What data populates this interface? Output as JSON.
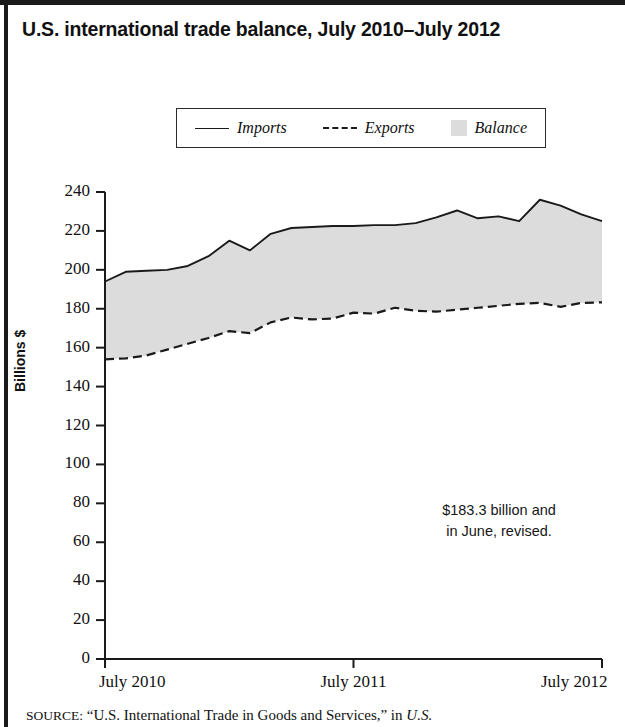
{
  "figure": {
    "title": "U.S. international trade balance, July 2010–July 2012",
    "annotation_line1": "$183.3 billion and",
    "annotation_line2": "in June, revised.",
    "source_prefix": "SOURCE:",
    "source_text": "“U.S. International Trade in Goods and Services,” in",
    "source_italic": "U.S."
  },
  "legend": {
    "items": [
      {
        "label": "Imports",
        "style": "solid",
        "color": "#1a1a1a"
      },
      {
        "label": "Exports",
        "style": "dashed",
        "color": "#1a1a1a"
      },
      {
        "label": "Balance",
        "style": "fill",
        "color": "#dcdcdc"
      }
    ]
  },
  "chart_data": {
    "type": "area",
    "title": "U.S. international trade balance, July 2010–July 2012",
    "xlabel": "",
    "ylabel": "Billions $",
    "ylim": [
      0,
      240
    ],
    "ytick_step": 20,
    "yticks": [
      0,
      20,
      40,
      60,
      80,
      100,
      120,
      140,
      160,
      180,
      200,
      220,
      240
    ],
    "grid": false,
    "legend_position": "top-center",
    "x": [
      "July 2010",
      "Aug 2010",
      "Sep 2010",
      "Oct 2010",
      "Nov 2010",
      "Dec 2010",
      "Jan 2011",
      "Feb 2011",
      "Mar 2011",
      "Apr 2011",
      "May 2011",
      "June 2011",
      "July 2011",
      "Aug 2011",
      "Sep 2011",
      "Oct 2011",
      "Nov 2011",
      "Dec 2011",
      "Jan 2012",
      "Feb 2012",
      "Mar 2012",
      "Apr 2012",
      "May 2012",
      "June 2012",
      "July 2012"
    ],
    "xtick_labels": [
      "July 2010",
      "July 2011",
      "July 2012"
    ],
    "xtick_indices": [
      0,
      12,
      24
    ],
    "series": [
      {
        "name": "Imports",
        "style": "solid",
        "values": [
          194.0,
          199.0,
          199.5,
          200.0,
          202.0,
          207.0,
          215.0,
          210.0,
          218.5,
          221.5,
          222.0,
          222.5,
          222.5,
          223.0,
          223.0,
          224.0,
          227.0,
          230.5,
          226.5,
          227.5,
          225.0,
          236.0,
          233.0,
          228.5,
          225.0
        ]
      },
      {
        "name": "Exports",
        "style": "dashed",
        "values": [
          154.0,
          154.5,
          156.0,
          159.0,
          162.0,
          165.0,
          168.5,
          167.5,
          173.0,
          175.5,
          174.5,
          175.0,
          178.0,
          177.5,
          180.5,
          179.0,
          178.5,
          179.5,
          180.5,
          181.5,
          182.5,
          183.0,
          181.0,
          183.0,
          183.3
        ]
      }
    ],
    "band": {
      "name": "Balance",
      "between": [
        "Imports",
        "Exports"
      ],
      "fill": "#dcdcdc"
    }
  }
}
